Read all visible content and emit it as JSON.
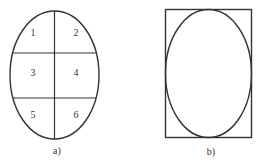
{
  "figure_a": {
    "caption": "a)",
    "regions": [
      {
        "label": "1"
      },
      {
        "label": "2"
      },
      {
        "label": "3"
      },
      {
        "label": "4"
      },
      {
        "label": "5"
      },
      {
        "label": "6"
      }
    ]
  },
  "figure_b": {
    "caption": "b)"
  },
  "colors": {
    "stroke": "#333333",
    "background": "#ffffff"
  }
}
